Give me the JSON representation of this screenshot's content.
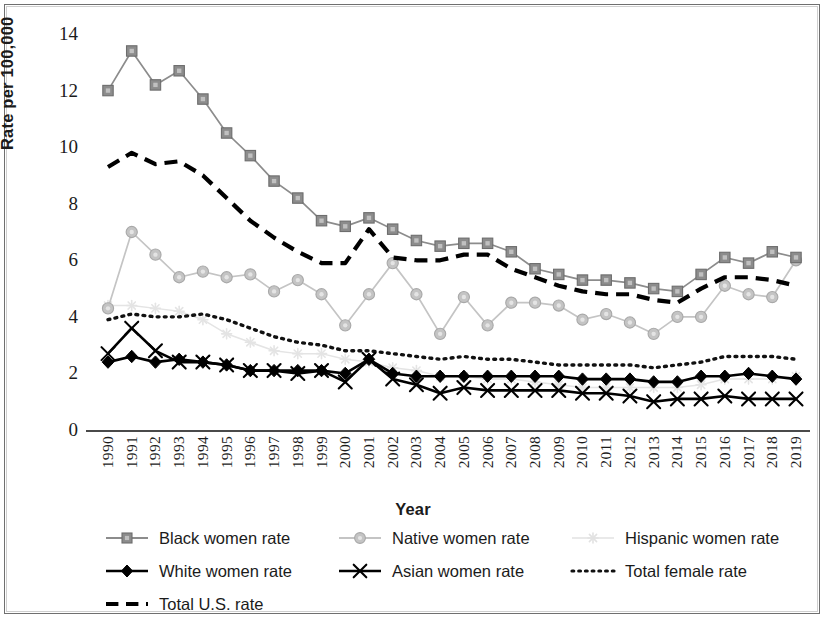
{
  "chart_data": {
    "type": "line",
    "title": "",
    "xlabel": "Year",
    "ylabel": "Rate per 100,000",
    "xlim": [
      1990,
      2019
    ],
    "ylim": [
      0,
      14
    ],
    "yticks": [
      0,
      2,
      4,
      6,
      8,
      10,
      12,
      14
    ],
    "grid": false,
    "legend_position": "bottom",
    "categories": [
      "1990",
      "1991",
      "1992",
      "1993",
      "1994",
      "1995",
      "1996",
      "1997",
      "1998",
      "1999",
      "2000",
      "2001",
      "2002",
      "2003",
      "2004",
      "2005",
      "2006",
      "2007",
      "2008",
      "2009",
      "2010",
      "2011",
      "2012",
      "2013",
      "2014",
      "2015",
      "2016",
      "2017",
      "2018",
      "2019"
    ],
    "series": [
      {
        "name": "Black women rate",
        "marker": "square",
        "color": "#8c8c8c",
        "line_style": "solid",
        "values": [
          12.0,
          13.4,
          12.2,
          12.7,
          11.7,
          10.5,
          9.7,
          8.8,
          8.2,
          7.4,
          7.2,
          7.5,
          7.1,
          6.7,
          6.5,
          6.6,
          6.6,
          6.3,
          5.7,
          5.5,
          5.3,
          5.3,
          5.2,
          5.0,
          4.9,
          5.5,
          6.1,
          5.9,
          6.3,
          6.1
        ]
      },
      {
        "name": "Native women rate",
        "marker": "circle",
        "color": "#c4c4c4",
        "line_style": "solid",
        "values": [
          4.3,
          7.0,
          6.2,
          5.4,
          5.6,
          5.4,
          5.5,
          4.9,
          5.3,
          4.8,
          3.7,
          4.8,
          5.9,
          4.8,
          3.4,
          4.7,
          3.7,
          4.5,
          4.5,
          4.4,
          3.9,
          4.1,
          3.8,
          3.4,
          4.0,
          4.0,
          5.1,
          4.8,
          4.7,
          6.0
        ]
      },
      {
        "name": "Hispanic women rate",
        "marker": "star",
        "color": "#e4e4e4",
        "line_style": "solid",
        "values": [
          4.4,
          4.4,
          4.3,
          4.2,
          3.9,
          3.4,
          3.1,
          2.8,
          2.7,
          2.7,
          2.5,
          2.4,
          2.2,
          2.1,
          1.9,
          1.9,
          1.8,
          1.8,
          1.7,
          1.6,
          1.5,
          1.5,
          1.5,
          1.5,
          1.5,
          1.6,
          1.8,
          1.8,
          1.8,
          1.9
        ]
      },
      {
        "name": "White women rate",
        "marker": "diamond",
        "color": "#000000",
        "line_style": "solid",
        "values": [
          2.4,
          2.6,
          2.4,
          2.5,
          2.4,
          2.3,
          2.1,
          2.1,
          2.1,
          2.1,
          2.0,
          2.5,
          2.0,
          1.9,
          1.9,
          1.9,
          1.9,
          1.9,
          1.9,
          1.9,
          1.8,
          1.8,
          1.8,
          1.7,
          1.7,
          1.9,
          1.9,
          2.0,
          1.9,
          1.8
        ]
      },
      {
        "name": "Asian women rate",
        "marker": "x",
        "color": "#000000",
        "line_style": "solid",
        "values": [
          2.7,
          3.6,
          2.8,
          2.4,
          2.4,
          2.3,
          2.1,
          2.1,
          2.0,
          2.1,
          1.7,
          2.5,
          1.8,
          1.6,
          1.3,
          1.5,
          1.4,
          1.4,
          1.4,
          1.4,
          1.3,
          1.3,
          1.2,
          1.0,
          1.1,
          1.1,
          1.2,
          1.1,
          1.1,
          1.1
        ]
      },
      {
        "name": "Total female rate",
        "marker": "none",
        "color": "#111111",
        "line_style": "dotted",
        "values": [
          3.9,
          4.1,
          4.0,
          4.0,
          4.1,
          3.9,
          3.6,
          3.3,
          3.1,
          3.0,
          2.8,
          2.8,
          2.7,
          2.6,
          2.5,
          2.6,
          2.5,
          2.5,
          2.4,
          2.3,
          2.3,
          2.3,
          2.3,
          2.2,
          2.3,
          2.4,
          2.6,
          2.6,
          2.6,
          2.5
        ]
      },
      {
        "name": "Total U.S. rate",
        "marker": "none",
        "color": "#000000",
        "line_style": "dashed",
        "values": [
          9.3,
          9.8,
          9.4,
          9.5,
          9.0,
          8.2,
          7.4,
          6.8,
          6.3,
          5.9,
          5.9,
          7.1,
          6.1,
          6.0,
          6.0,
          6.2,
          6.2,
          5.7,
          5.4,
          5.1,
          4.9,
          4.8,
          4.8,
          4.6,
          4.5,
          5.0,
          5.4,
          5.4,
          5.3,
          5.1
        ]
      }
    ]
  },
  "axes": {
    "y_title": "Rate per 100,000",
    "x_title": "Year",
    "y_tick_labels": [
      "14",
      "12",
      "10",
      "8",
      "6",
      "4",
      "2",
      "0"
    ],
    "x_tick_labels": [
      "1990",
      "1991",
      "1992",
      "1993",
      "1994",
      "1995",
      "1996",
      "1997",
      "1998",
      "1999",
      "2000",
      "2001",
      "2002",
      "2003",
      "2004",
      "2005",
      "2006",
      "2007",
      "2008",
      "2009",
      "2010",
      "2011",
      "2012",
      "2013",
      "2014",
      "2015",
      "2016",
      "2017",
      "2018",
      "2019"
    ]
  },
  "legend": {
    "items": [
      {
        "label": "Black women rate",
        "marker": "square",
        "color": "#8c8c8c",
        "line_style": "solid",
        "col": 0,
        "row": 0
      },
      {
        "label": "Native women rate",
        "marker": "circle",
        "color": "#c4c4c4",
        "line_style": "solid",
        "col": 1,
        "row": 0
      },
      {
        "label": "Hispanic women rate",
        "marker": "star",
        "color": "#e2e2e2",
        "line_style": "solid",
        "col": 2,
        "row": 0
      },
      {
        "label": "White women rate",
        "marker": "diamond",
        "color": "#000000",
        "line_style": "solid",
        "col": 0,
        "row": 1
      },
      {
        "label": "Asian women rate",
        "marker": "x",
        "color": "#000000",
        "line_style": "solid",
        "col": 1,
        "row": 1
      },
      {
        "label": "Total female rate",
        "marker": "none",
        "color": "#111111",
        "line_style": "dotted",
        "col": 2,
        "row": 1
      },
      {
        "label": "Total U.S. rate",
        "marker": "none",
        "color": "#000000",
        "line_style": "dashed",
        "col": 0,
        "row": 2
      }
    ]
  }
}
